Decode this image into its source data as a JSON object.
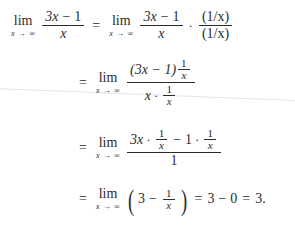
{
  "document": {
    "kind": "math-derivation",
    "subject": "Limit at infinity of (3x - 1)/x",
    "result": "3"
  },
  "symbols": {
    "equals": "=",
    "minus": "−",
    "dot": "·",
    "arrow": "→",
    "infinity": "∞",
    "lim": "lim",
    "paren_open": "(",
    "paren_close": ")",
    "period": "."
  },
  "limit": {
    "variable": "x",
    "approaches": "∞"
  },
  "line1": {
    "lhs": {
      "numerator_a": "3x",
      "numerator_b": "1",
      "denominator": "x"
    },
    "rhs": {
      "numerator_a": "3x",
      "numerator_b": "1",
      "denominator": "x",
      "multiplier_numerator": "(1/x)",
      "multiplier_denominator": "(1/x)"
    }
  },
  "line2": {
    "numerator": {
      "group": "(3x − 1)",
      "factor_top": "1",
      "factor_bottom": "x"
    },
    "denominator": {
      "left": "x",
      "factor_top": "1",
      "factor_bottom": "x"
    }
  },
  "line3": {
    "numerator": {
      "term1_coeff": "3x",
      "term1_top": "1",
      "term1_bottom": "x",
      "term2_coeff": "1",
      "term2_top": "1",
      "term2_bottom": "x"
    },
    "denominator": "1"
  },
  "line4": {
    "expression": {
      "leading": "3",
      "fraction_top": "1",
      "fraction_bottom": "x"
    },
    "evaluation": {
      "first": "3",
      "second": "0",
      "result": "3"
    }
  },
  "colors": {
    "ink": "#2b2b2b",
    "page": "#ffffff",
    "artifact": "#e4e4e4"
  }
}
